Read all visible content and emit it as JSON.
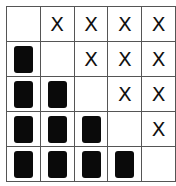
{
  "grid": {
    "rows": [
      [
        "",
        "X",
        "X",
        "X",
        "X"
      ],
      [
        "block",
        "",
        "X",
        "X",
        "X"
      ],
      [
        "block",
        "block",
        "",
        "X",
        "X"
      ],
      [
        "block",
        "block",
        "block",
        "",
        "X"
      ],
      [
        "block",
        "block",
        "block",
        "block",
        ""
      ]
    ],
    "x_symbol": "X"
  }
}
